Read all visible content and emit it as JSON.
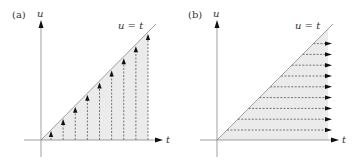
{
  "colors": {
    "axis": "#888888",
    "diagonal": "#888888",
    "shade": "#ebebeb",
    "dash": "#555555",
    "arrow": "#111111",
    "text": "#333333"
  },
  "panels": [
    {
      "id": "a",
      "label": "(a)",
      "y_axis_label": "u",
      "x_axis_label": "t",
      "line_label": "u = t",
      "arrow_direction": "vertical",
      "arrow_count": 9
    },
    {
      "id": "b",
      "label": "(b)",
      "y_axis_label": "u",
      "x_axis_label": "t",
      "line_label": "u = t",
      "arrow_direction": "horizontal",
      "arrow_count": 9
    }
  ]
}
